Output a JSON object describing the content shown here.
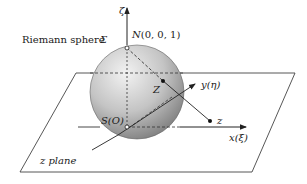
{
  "figure": {
    "labels": {
      "sphere": "Riemann sphere",
      "sphere_symbol": "Σ",
      "north_pole": "N(0, 0, 1)",
      "south_pole": "S(O)",
      "zeta_axis": "ζ",
      "y_axis": "y(η)",
      "x_axis": "x(ξ)",
      "point_on_sphere": "Z",
      "point_on_plane": "z",
      "plane": "z plane"
    },
    "colors": {
      "line": "#333333",
      "sphere_light": "#eeeeee",
      "sphere_dark": "#8a8a8a",
      "background": "#ffffff"
    }
  }
}
